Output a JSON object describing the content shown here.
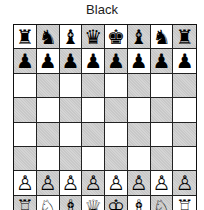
{
  "header": {
    "side_label": "Black"
  },
  "board": {
    "orientation": "black-at-top",
    "colors": {
      "light": "#ffffff",
      "dark": "#d4d4d4",
      "grid": "#222222"
    },
    "ranks": [
      {
        "rank": 8,
        "squares": [
          {
            "file": "a",
            "piece": "rook",
            "color": "black",
            "glyph": "♜"
          },
          {
            "file": "b",
            "piece": "knight",
            "color": "black",
            "glyph": "♞"
          },
          {
            "file": "c",
            "piece": "bishop",
            "color": "black",
            "glyph": "♝"
          },
          {
            "file": "d",
            "piece": "queen",
            "color": "black",
            "glyph": "♛"
          },
          {
            "file": "e",
            "piece": "king",
            "color": "black",
            "glyph": "♚"
          },
          {
            "file": "f",
            "piece": "bishop",
            "color": "black",
            "glyph": "♝"
          },
          {
            "file": "g",
            "piece": "knight",
            "color": "black",
            "glyph": "♞"
          },
          {
            "file": "h",
            "piece": "rook",
            "color": "black",
            "glyph": "♜"
          }
        ]
      },
      {
        "rank": 7,
        "squares": [
          {
            "file": "a",
            "piece": "pawn",
            "color": "black",
            "glyph": "♟"
          },
          {
            "file": "b",
            "piece": "pawn",
            "color": "black",
            "glyph": "♟"
          },
          {
            "file": "c",
            "piece": "pawn",
            "color": "black",
            "glyph": "♟"
          },
          {
            "file": "d",
            "piece": "pawn",
            "color": "black",
            "glyph": "♟"
          },
          {
            "file": "e",
            "piece": "pawn",
            "color": "black",
            "glyph": "♟"
          },
          {
            "file": "f",
            "piece": "pawn",
            "color": "black",
            "glyph": "♟"
          },
          {
            "file": "g",
            "piece": "pawn",
            "color": "black",
            "glyph": "♟"
          },
          {
            "file": "h",
            "piece": "pawn",
            "color": "black",
            "glyph": "♟"
          }
        ]
      },
      {
        "rank": 6,
        "squares": [
          {
            "file": "a",
            "glyph": ""
          },
          {
            "file": "b",
            "glyph": ""
          },
          {
            "file": "c",
            "glyph": ""
          },
          {
            "file": "d",
            "glyph": ""
          },
          {
            "file": "e",
            "glyph": ""
          },
          {
            "file": "f",
            "glyph": ""
          },
          {
            "file": "g",
            "glyph": ""
          },
          {
            "file": "h",
            "glyph": ""
          }
        ]
      },
      {
        "rank": 5,
        "squares": [
          {
            "file": "a",
            "glyph": ""
          },
          {
            "file": "b",
            "glyph": ""
          },
          {
            "file": "c",
            "glyph": ""
          },
          {
            "file": "d",
            "glyph": ""
          },
          {
            "file": "e",
            "glyph": ""
          },
          {
            "file": "f",
            "glyph": ""
          },
          {
            "file": "g",
            "glyph": ""
          },
          {
            "file": "h",
            "glyph": ""
          }
        ]
      },
      {
        "rank": 4,
        "squares": [
          {
            "file": "a",
            "glyph": ""
          },
          {
            "file": "b",
            "glyph": ""
          },
          {
            "file": "c",
            "glyph": ""
          },
          {
            "file": "d",
            "glyph": ""
          },
          {
            "file": "e",
            "glyph": ""
          },
          {
            "file": "f",
            "glyph": ""
          },
          {
            "file": "g",
            "glyph": ""
          },
          {
            "file": "h",
            "glyph": ""
          }
        ]
      },
      {
        "rank": 3,
        "squares": [
          {
            "file": "a",
            "glyph": ""
          },
          {
            "file": "b",
            "glyph": ""
          },
          {
            "file": "c",
            "glyph": ""
          },
          {
            "file": "d",
            "glyph": ""
          },
          {
            "file": "e",
            "glyph": ""
          },
          {
            "file": "f",
            "glyph": ""
          },
          {
            "file": "g",
            "glyph": ""
          },
          {
            "file": "h",
            "glyph": ""
          }
        ]
      },
      {
        "rank": 2,
        "squares": [
          {
            "file": "a",
            "piece": "pawn",
            "color": "white",
            "glyph": "♙"
          },
          {
            "file": "b",
            "piece": "pawn",
            "color": "white",
            "glyph": "♙"
          },
          {
            "file": "c",
            "piece": "pawn",
            "color": "white",
            "glyph": "♙"
          },
          {
            "file": "d",
            "piece": "pawn",
            "color": "white",
            "glyph": "♙"
          },
          {
            "file": "e",
            "piece": "pawn",
            "color": "white",
            "glyph": "♙"
          },
          {
            "file": "f",
            "piece": "pawn",
            "color": "white",
            "glyph": "♙"
          },
          {
            "file": "g",
            "piece": "pawn",
            "color": "white",
            "glyph": "♙"
          },
          {
            "file": "h",
            "piece": "pawn",
            "color": "white",
            "glyph": "♙"
          }
        ]
      },
      {
        "rank": 1,
        "squares": [
          {
            "file": "a",
            "piece": "rook",
            "color": "white",
            "glyph": "♖"
          },
          {
            "file": "b",
            "piece": "knight",
            "color": "white",
            "glyph": "♘"
          },
          {
            "file": "c",
            "piece": "bishop",
            "color": "white",
            "glyph": "♗"
          },
          {
            "file": "d",
            "piece": "queen",
            "color": "white",
            "glyph": "♕"
          },
          {
            "file": "e",
            "piece": "king",
            "color": "white",
            "glyph": "♔"
          },
          {
            "file": "f",
            "piece": "bishop",
            "color": "white",
            "glyph": "♗"
          },
          {
            "file": "g",
            "piece": "knight",
            "color": "white",
            "glyph": "♘"
          },
          {
            "file": "h",
            "piece": "rook",
            "color": "white",
            "glyph": "♖"
          }
        ]
      }
    ]
  }
}
